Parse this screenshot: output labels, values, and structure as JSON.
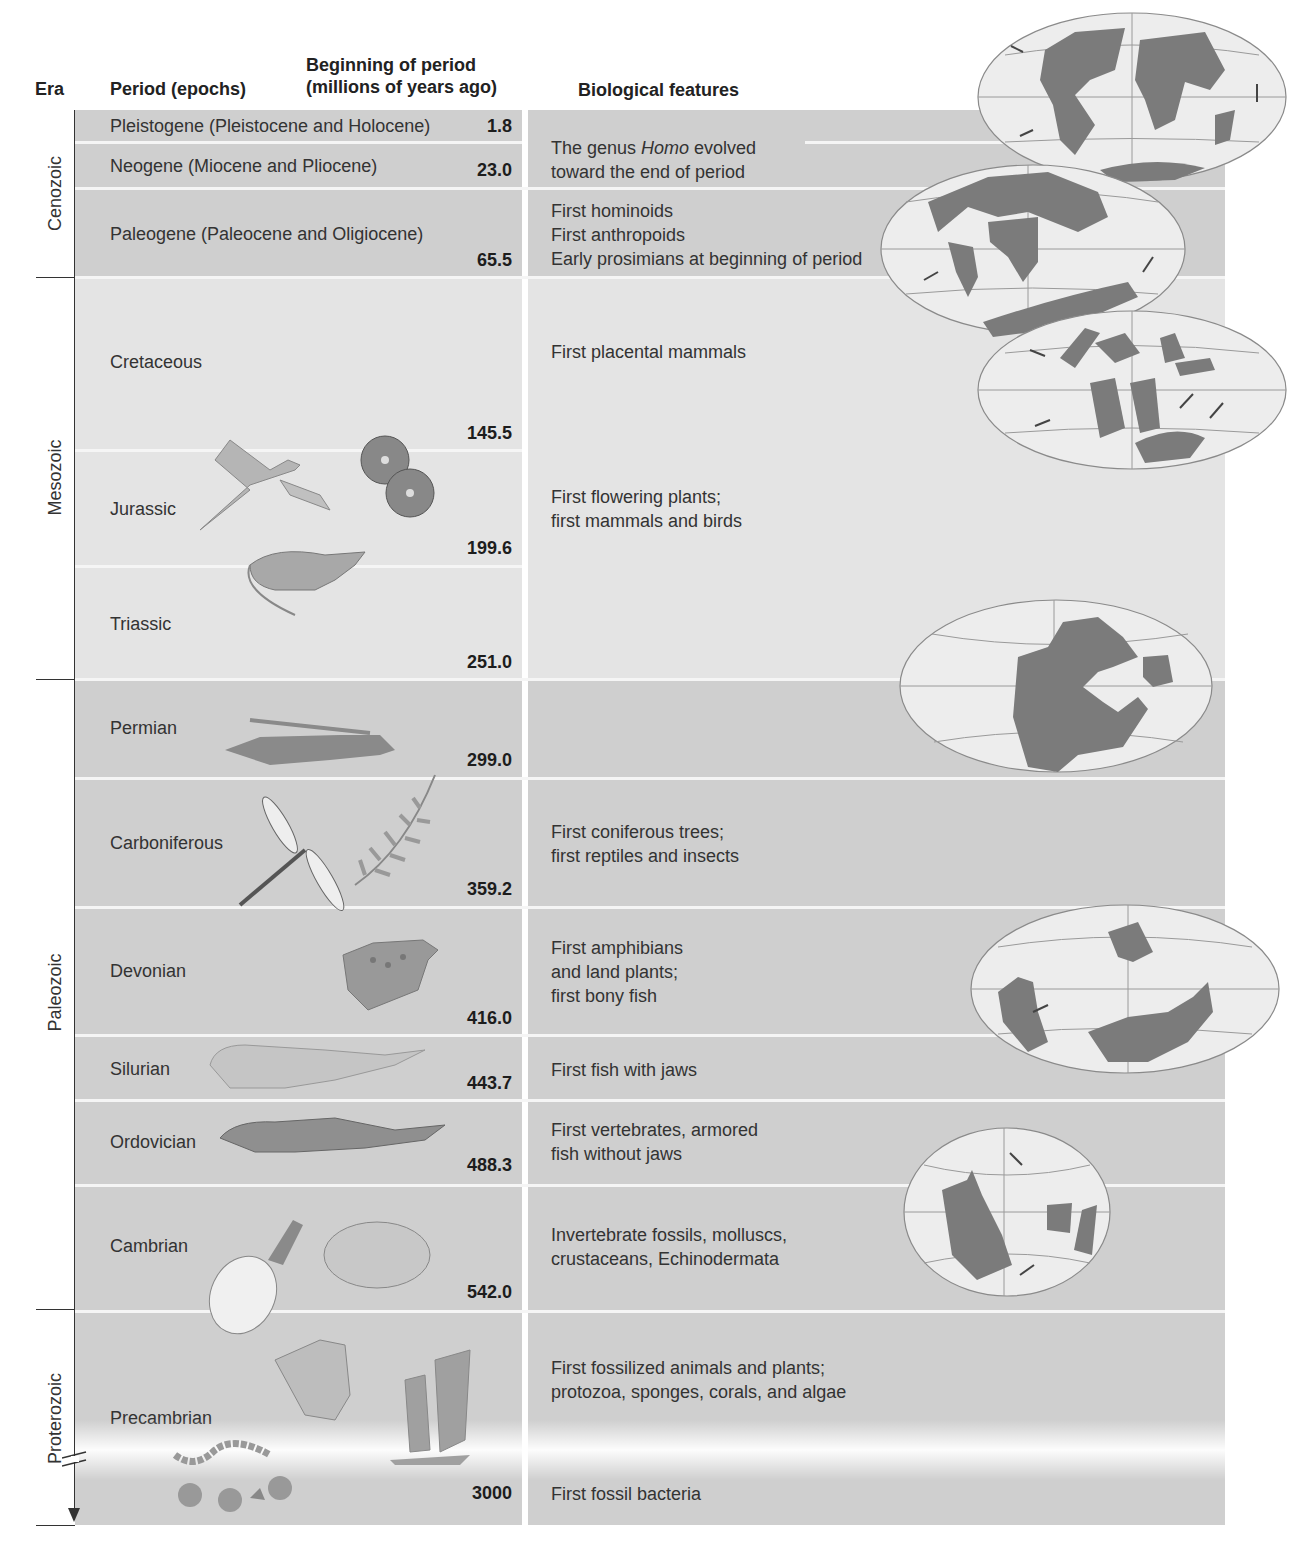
{
  "headers": {
    "era": "Era",
    "period": "Period (epochs)",
    "beginning_line1": "Beginning of period",
    "beginning_line2": "(millions of years ago)",
    "biological": "Biological features"
  },
  "eras": [
    {
      "name": "Cenozoic"
    },
    {
      "name": "Mesozoic"
    },
    {
      "name": "Paleozoic"
    },
    {
      "name": "Proterozoic"
    }
  ],
  "periods": [
    {
      "name": "Pleistogene (Pleistocene and Holocene)",
      "mya": "1.8",
      "era": "Cenozoic"
    },
    {
      "name": "Neogene (Miocene and Pliocene)",
      "mya": "23.0",
      "era": "Cenozoic"
    },
    {
      "name": "Paleogene (Paleocene and Oligiocene)",
      "mya": "65.5",
      "era": "Cenozoic"
    },
    {
      "name": "Cretaceous",
      "mya": "145.5",
      "era": "Mesozoic"
    },
    {
      "name": "Jurassic",
      "mya": "199.6",
      "era": "Mesozoic"
    },
    {
      "name": "Triassic",
      "mya": "251.0",
      "era": "Mesozoic"
    },
    {
      "name": "Permian",
      "mya": "299.0",
      "era": "Paleozoic"
    },
    {
      "name": "Carboniferous",
      "mya": "359.2",
      "era": "Paleozoic"
    },
    {
      "name": "Devonian",
      "mya": "416.0",
      "era": "Paleozoic"
    },
    {
      "name": "Silurian",
      "mya": "443.7",
      "era": "Paleozoic"
    },
    {
      "name": "Ordovician",
      "mya": "488.3",
      "era": "Paleozoic"
    },
    {
      "name": "Cambrian",
      "mya": "542.0",
      "era": "Paleozoic"
    },
    {
      "name": "Precambrian",
      "mya": "3000",
      "era": "Proterozoic"
    }
  ],
  "biological_features": {
    "homo": {
      "pre": "The genus ",
      "italic": "Homo",
      "post": " evolved",
      "line2": "toward the end of period"
    },
    "paleogene": [
      "First hominoids",
      "First anthropoids",
      "Early prosimians at beginning of period"
    ],
    "cretaceous": [
      "First placental mammals"
    ],
    "jurassic": [
      "First flowering plants;",
      "first mammals and birds"
    ],
    "carboniferous": [
      "First coniferous trees;",
      "first reptiles and insects"
    ],
    "devonian": [
      "First amphibians",
      "and land plants;",
      "first bony fish"
    ],
    "silurian": [
      "First fish with jaws"
    ],
    "ordovician": [
      "First vertebrates, armored",
      "fish without jaws"
    ],
    "cambrian": [
      "Invertebrate fossils, molluscs,",
      "crustaceans, Echinodermata"
    ],
    "precambrian_upper": [
      "First fossilized animals and plants;",
      "protozoa, sponges, corals, and algae"
    ],
    "precambrian_lower": [
      "First fossil bacteria"
    ]
  },
  "maps": [
    {
      "name": "present-day-continents-map"
    },
    {
      "name": "cenozoic-continents-map"
    },
    {
      "name": "cretaceous-continents-map"
    },
    {
      "name": "pangaea-map"
    },
    {
      "name": "devonian-continents-map"
    },
    {
      "name": "cambrian-continents-map"
    }
  ],
  "illustrations": [
    {
      "name": "archaeopteryx-illustration"
    },
    {
      "name": "flowering-plant-illustration"
    },
    {
      "name": "early-mammal-illustration"
    },
    {
      "name": "reptile-illustration"
    },
    {
      "name": "dragonfly-illustration"
    },
    {
      "name": "fern-illustration"
    },
    {
      "name": "amphibian-illustration"
    },
    {
      "name": "jawed-fish-illustration"
    },
    {
      "name": "jawless-fish-illustration"
    },
    {
      "name": "mollusc-illustration"
    },
    {
      "name": "trilobite-illustration"
    },
    {
      "name": "algae-illustration"
    },
    {
      "name": "sponge-illustration"
    },
    {
      "name": "bacteria-illustration"
    }
  ],
  "colors": {
    "band_dark": "#cfcfcf",
    "band_light": "#e4e4e4",
    "continent": "#7b7b7b"
  }
}
